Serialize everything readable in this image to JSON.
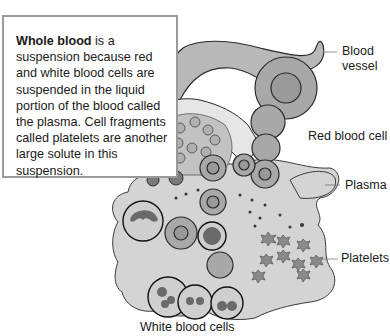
{
  "textbox": {
    "term": "Whole blood",
    "body": " is a suspension because red and white blood cells are suspended in the liquid portion of the blood called the plasma. Cell fragments called platelets are another large solute in this suspension."
  },
  "labels": {
    "blood_vessel_line1": "Blood",
    "blood_vessel_line2": "vessel",
    "red_blood_cell": "Red blood cell",
    "plasma": "Plasma",
    "platelets": "Platelets",
    "white_blood_cells": "White blood cells"
  },
  "colors": {
    "plasma_fill": "#d4d4d4",
    "vessel_fill": "#b8b8b8",
    "cell_fill": "#a8a8a8",
    "outline": "#2a2a2a",
    "box_border": "#9a9a9a"
  }
}
